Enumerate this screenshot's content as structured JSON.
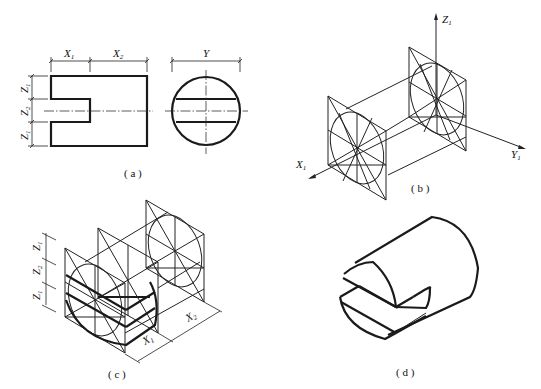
{
  "figure": {
    "panels": [
      {
        "id": "a",
        "caption": "( a )",
        "type": "orthographic-views",
        "dimension_labels": {
          "x1": "X",
          "x1_sub": "1",
          "x2": "X",
          "x2_sub": "2",
          "y": "Y",
          "z1_top": "Z",
          "z1_top_sub": "1",
          "z2": "Z",
          "z2_sub": "2",
          "z1_bottom": "Z",
          "z1_bottom_sub": "1"
        }
      },
      {
        "id": "b",
        "caption": "( b )",
        "type": "axonometric-axes-with-end-faces",
        "axis_labels": {
          "z": "Z",
          "z_sub": "1",
          "x": "X",
          "x_sub": "1",
          "y": "Y",
          "y_sub": "1"
        }
      },
      {
        "id": "c",
        "caption": "( c )",
        "type": "axonometric-construction",
        "dimension_labels": {
          "z1_top": "Z",
          "z1_top_sub": "1",
          "z2": "Z",
          "z2_sub": "2",
          "z1_bottom": "Z",
          "z1_bottom_sub": "1",
          "x1": "X",
          "x1_sub": "1",
          "x2": "X",
          "x2_sub": "2"
        }
      },
      {
        "id": "d",
        "caption": "( d )",
        "type": "final-axonometric-cylinder-with-slot"
      }
    ],
    "colors": {
      "line": "#1a1a1a",
      "background": "#ffffff"
    }
  }
}
